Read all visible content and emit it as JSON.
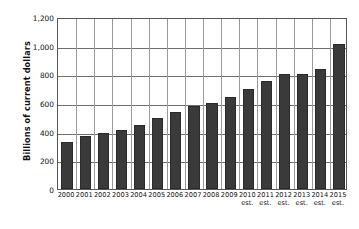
{
  "chart_data": {
    "type": "bar",
    "title": "",
    "xlabel": "",
    "ylabel": "Billions of current dollars",
    "ylim": [
      0,
      1200
    ],
    "yticks": [
      0,
      200,
      400,
      600,
      800,
      1000,
      1200
    ],
    "ytick_labels": [
      "0",
      "200",
      "400",
      "600",
      "800",
      "1,000",
      "1,200"
    ],
    "grid": true,
    "legend": "none",
    "bar_color": "#3a3a3a",
    "categories": [
      "2000",
      "2001",
      "2002",
      "2003",
      "2004",
      "2005",
      "2006",
      "2007",
      "2008",
      "2009",
      "2010",
      "2011",
      "2012",
      "2013",
      "2014",
      "2015"
    ],
    "category_suffixes": [
      "",
      "",
      "",
      "",
      "",
      "",
      "",
      "",
      "",
      "",
      "est.",
      "est.",
      "est.",
      "est.",
      "est.",
      "est."
    ],
    "values": [
      325,
      370,
      390,
      415,
      445,
      495,
      535,
      580,
      600,
      640,
      700,
      755,
      800,
      800,
      840,
      1010
    ]
  }
}
